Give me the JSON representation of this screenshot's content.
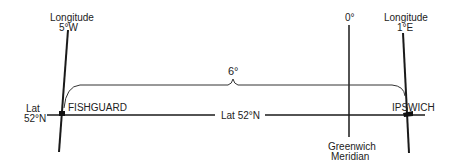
{
  "diagram": {
    "left_meridian": {
      "title": "Longitude",
      "value": "5°W"
    },
    "right_meridian": {
      "title": "Longitude",
      "value": "1°E"
    },
    "prime_meridian": {
      "top_label": "0°",
      "bottom_label_line1": "Greenwich",
      "bottom_label_line2": "Meridian"
    },
    "latitude": {
      "left_label_line1": "Lat",
      "left_label_line2": "52°N",
      "center_label": "Lat  52°N"
    },
    "span_label": "6°",
    "cities": {
      "west": "FISHGUARD",
      "east": "IPSWICH"
    },
    "colors": {
      "line": "#1a1a1a",
      "text": "#222222",
      "background": "#ffffff"
    }
  }
}
